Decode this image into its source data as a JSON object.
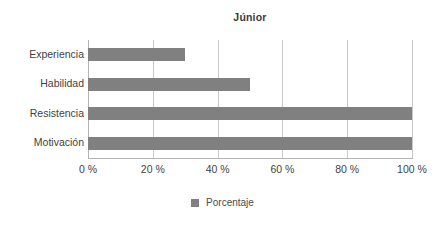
{
  "chart_data": {
    "type": "bar",
    "orientation": "horizontal",
    "title": "Júnior",
    "categories": [
      "Experiencia",
      "Habilidad",
      "Resistencia",
      "Motivación"
    ],
    "values": [
      30,
      50,
      100,
      100
    ],
    "series": [
      {
        "name": "Porcentaje",
        "values": [
          30,
          50,
          100,
          100
        ],
        "color": "#808080"
      }
    ],
    "xlabel": "",
    "ylabel": "",
    "xlim": [
      0,
      100
    ],
    "xticks": [
      0,
      20,
      40,
      60,
      80,
      100
    ],
    "xtick_labels": [
      "0 %",
      "20 %",
      "40 %",
      "60 %",
      "80 %",
      "100 %"
    ],
    "grid": "vertical",
    "legend": {
      "position": "bottom",
      "entries": [
        {
          "label": "Porcentaje",
          "color": "#808080",
          "marker": "square-swatch"
        }
      ]
    },
    "colors": {
      "bar": "#808080",
      "gridline": "#c9c9c9",
      "axis": "#b4b4b4",
      "text": "#3f3f3f",
      "background": "#ffffff"
    }
  }
}
